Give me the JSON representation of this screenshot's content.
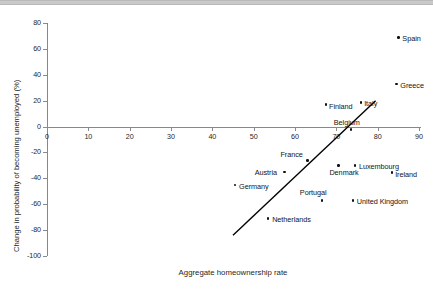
{
  "figure": {
    "background_color": "#ffffff",
    "axis_color": "#888888",
    "marker_color": "#111111",
    "trendline_color": "#000000",
    "topbar_color": "#c2c2c2"
  },
  "chart_data": {
    "type": "scatter",
    "title": "",
    "xlabel": "Aggregate homeownership rate",
    "ylabel": "Change in probability of becoming unemployed (%)",
    "xlim": [
      0,
      90
    ],
    "ylim": [
      -100,
      80
    ],
    "xticks": [
      0,
      10,
      20,
      30,
      40,
      50,
      60,
      70,
      80,
      90
    ],
    "yticks": [
      80,
      60,
      40,
      20,
      0,
      -20,
      -40,
      -60,
      -80,
      -100
    ],
    "xtick_labels": [
      "0",
      "10",
      "20",
      "30",
      "40",
      "50",
      "60",
      "70",
      "80",
      "90"
    ],
    "ytick_labels": [
      "80",
      "60",
      "40",
      "20",
      "0",
      "-20",
      "-40",
      "-60",
      "-80",
      "-100"
    ],
    "grid": false,
    "legend": "none",
    "points": [
      {
        "label": "Spain",
        "x": 85.0,
        "y": 69.0,
        "label_dx": 4,
        "label_dy": -3
      },
      {
        "label": "Greece",
        "x": 84.5,
        "y": 33.0,
        "label_dx": 4,
        "label_dy": -3
      },
      {
        "label": "Finland",
        "x": 67.5,
        "y": 17.0,
        "label_dx": 3,
        "label_dy": -3
      },
      {
        "label": "Italy",
        "x": 76.0,
        "y": 18.5,
        "label_dx": 3,
        "label_dy": -4
      },
      {
        "label": "Belgium",
        "x": 73.5,
        "y": -2.5,
        "label_dx": -17,
        "label_dy": -12
      },
      {
        "label": "France",
        "x": 63.0,
        "y": -26.0,
        "label_dx": -27,
        "label_dy": -10
      },
      {
        "label": "Luxembourg",
        "x": 74.5,
        "y": -30.0,
        "label_dx": 4,
        "label_dy": -3
      },
      {
        "label": "Denmark",
        "x": 70.5,
        "y": -30.0,
        "label_dx": -9,
        "label_dy": 3
      },
      {
        "label": "Austria",
        "x": 57.5,
        "y": -35.0,
        "label_dx": -30,
        "label_dy": -4
      },
      {
        "label": "Ireland",
        "x": 83.5,
        "y": -35.5,
        "label_dx": 3,
        "label_dy": -3
      },
      {
        "label": "Germany",
        "x": 45.5,
        "y": -45.0,
        "label_dx": 4,
        "label_dy": -3
      },
      {
        "label": "Portugal",
        "x": 66.5,
        "y": -57.0,
        "label_dx": -22,
        "label_dy": -12
      },
      {
        "label": "United Kingdom",
        "x": 74.0,
        "y": -57.0,
        "label_dx": 4,
        "label_dy": -3
      },
      {
        "label": "Netherlands",
        "x": 53.5,
        "y": -71.0,
        "label_dx": 4,
        "label_dy": -3
      }
    ],
    "trendline": {
      "x0": 45.0,
      "y0": -84.0,
      "x1": 79.5,
      "y1": 20.0
    }
  }
}
